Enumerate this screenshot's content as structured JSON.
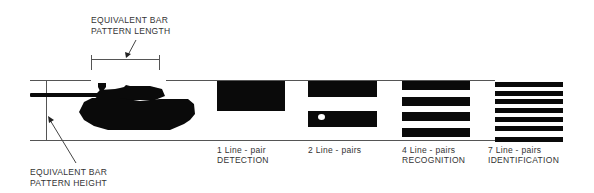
{
  "diagram": {
    "annotations": {
      "length_label": [
        "EQUIVALENT BAR",
        "PATTERN LENGTH"
      ],
      "height_label": [
        "EQUIVALENT BAR",
        "PATTERN HEIGHT"
      ]
    },
    "target": {
      "name": "tank-silhouette"
    },
    "patterns": [
      {
        "line_pairs": 1,
        "caption_1": "1 Line - pair",
        "caption_2": "DETECTION"
      },
      {
        "line_pairs": 2,
        "caption_1": "2 Line - pairs",
        "caption_2": ""
      },
      {
        "line_pairs": 4,
        "caption_1": "4 Line - pairs",
        "caption_2": "RECOGNITION"
      },
      {
        "line_pairs": 7,
        "caption_1": "7 Line - pairs",
        "caption_2": "IDENTIFICATION"
      }
    ],
    "colors": {
      "bar": "#0a0a0a",
      "line": "#555555",
      "text": "#333333"
    }
  }
}
